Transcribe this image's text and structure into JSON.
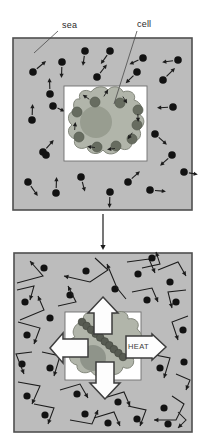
{
  "labels": {
    "sea": "sea",
    "cell": "cell",
    "heat": "HEAT"
  },
  "colors": {
    "background": "#ffffff",
    "sea_fill": "#bcbcbc",
    "panel_border": "#4f4f4f",
    "inner_fill": "#ffffff",
    "inner_border": "#6f6f6f",
    "cell_body": "#b1b5aa",
    "cell_edge": "#83877c",
    "nucleus_top": "#989d90",
    "nucleus_bottom": "#8f948a",
    "organelle": "#676c60",
    "organelle_edge": "#555a4f",
    "bead": "#575b52",
    "bead_edge": "#474b42",
    "dot": "#121212",
    "thin_line": "#1c1c1c",
    "leader_line": "#4a4a4a",
    "fat_arrow_fill": "#fdfdfd",
    "fat_arrow_edge": "#3d3d3d",
    "label_text": "#2a2a2a"
  },
  "top_panel": {
    "square": {
      "x": 13,
      "y": 38,
      "w": 179,
      "h": 172
    },
    "inner_square": {
      "x": 64,
      "y": 86,
      "w": 83,
      "h": 75
    },
    "cell_blob_path": "M 80,99 C 77,92 85,88 91,92 C 95,86 104,85 108,90 C 112,85 121,86 123,92 C 130,89 137,94 134,100 C 141,102 144,109 139,114 C 146,118 145,126 139,129 C 143,135 139,142 132,141 C 133,148 126,152 120,148 C 117,155 107,156 103,150 C 98,156 88,154 87,147 C 80,151 72,146 75,139 C 68,137 66,129 72,125 C 66,120 68,111 75,111 C 72,104 74,98 80,99 Z",
    "nucleus": {
      "cx": 96,
      "cy": 122,
      "r": 16
    },
    "organelles": [
      [
        77,
        112
      ],
      [
        95,
        102
      ],
      [
        120,
        103
      ],
      [
        138,
        110
      ],
      [
        137,
        125
      ],
      [
        132,
        139
      ],
      [
        116,
        146
      ],
      [
        97,
        147
      ],
      [
        79,
        137
      ]
    ],
    "organelle_radius": 5,
    "cell_arrows": [
      [
        86,
        97,
        145
      ],
      [
        106,
        93,
        58
      ],
      [
        125,
        100,
        302
      ],
      [
        138,
        118,
        272
      ],
      [
        130,
        136,
        235
      ],
      [
        111,
        149,
        188
      ],
      [
        91,
        147,
        172
      ],
      [
        75,
        126,
        85
      ]
    ],
    "cell_arrow_len": 8,
    "molecules": [
      [
        33,
        72,
        40,
        12
      ],
      [
        62,
        62,
        268,
        11
      ],
      [
        85,
        51,
        262,
        10
      ],
      [
        110,
        51,
        235,
        11
      ],
      [
        143,
        58,
        205,
        10
      ],
      [
        178,
        60,
        188,
        11
      ],
      [
        137,
        72,
        225,
        11
      ],
      [
        97,
        77,
        52,
        11
      ],
      [
        163,
        80,
        45,
        12
      ],
      [
        50,
        94,
        92,
        11
      ],
      [
        53,
        106,
        335,
        8
      ],
      [
        173,
        107,
        183,
        11
      ],
      [
        32,
        120,
        88,
        11
      ],
      [
        155,
        134,
        318,
        11
      ],
      [
        43,
        152,
        48,
        11
      ],
      [
        172,
        155,
        222,
        11
      ],
      [
        28,
        182,
        305,
        12
      ],
      [
        81,
        177,
        285,
        10
      ],
      [
        56,
        193,
        88,
        11
      ],
      [
        110,
        192,
        268,
        11
      ],
      [
        128,
        182,
        42,
        11
      ],
      [
        150,
        190,
        355,
        11
      ],
      [
        184,
        172,
        350,
        9
      ],
      [
        46,
        155,
        0,
        0
      ]
    ],
    "dot_radius": 3.8,
    "sea_leader": [
      58,
      31,
      34,
      53
    ],
    "cell_leader": [
      137,
      31,
      114,
      104
    ]
  },
  "mid_arrow": {
    "x": 103,
    "y1": 214,
    "y2": 250
  },
  "bottom_panel": {
    "square": {
      "x": 14,
      "y": 253,
      "w": 178,
      "h": 179
    },
    "inner_square": {
      "x": 65,
      "y": 312,
      "w": 76,
      "h": 68
    },
    "cell_blob_path": "M 84,321 C 81,314 89,310 95,314 C 100,308 110,308 114,314 C 120,309 129,312 128,319 C 135,317 141,323 137,329 C 143,333 143,341 137,344 C 142,349 140,357 133,358 C 136,365 129,371 123,367 C 122,374 113,377 108,372 C 103,378 94,377 91,371 C 85,375 76,372 77,365 C 70,364 67,356 72,352 C 66,347 68,339 75,337 C 70,331 76,322 84,321 Z",
    "nucleus": {
      "cx": 93,
      "cy": 358,
      "r": 13
    },
    "beads": {
      "x1": 82,
      "y1": 322,
      "x2": 123,
      "y2": 357,
      "n": 10,
      "r": 3.8
    },
    "fat_arrows": [
      {
        "name": "up",
        "tail": [
          103,
          334
        ],
        "tip": [
          103,
          297
        ],
        "head_len": 16,
        "head_half": 15,
        "shaft_half": 9
      },
      {
        "name": "down",
        "tail": [
          105,
          362
        ],
        "tip": [
          105,
          399
        ],
        "head_len": 16,
        "head_half": 15,
        "shaft_half": 9
      },
      {
        "name": "left",
        "tail": [
          88,
          348
        ],
        "tip": [
          50,
          348
        ],
        "head_len": 13,
        "head_half": 15,
        "shaft_half": 9
      },
      {
        "name": "heat-right",
        "tail": [
          126,
          347
        ],
        "tip": [
          166,
          347
        ],
        "head_len": 14,
        "head_half": 13,
        "shaft_half": 11
      }
    ],
    "dot_radius": 3.6,
    "molecules": [
      {
        "dot": [
          44,
          268
        ],
        "path": [
          [
            17,
            283
          ],
          [
            43,
            276
          ],
          [
            30,
            261
          ]
        ]
      },
      {
        "dot": [
          86,
          271
        ],
        "path": [
          [
            95,
            258
          ],
          [
            108,
            270
          ],
          [
            90,
            282
          ],
          [
            64,
            276
          ]
        ]
      },
      {
        "dot": [
          115,
          289
        ],
        "path": [
          [
            126,
            299
          ],
          [
            117,
            288
          ],
          [
            107,
            264
          ]
        ]
      },
      {
        "dot": [
          138,
          274
        ],
        "path": [
          [
            127,
            262
          ],
          [
            149,
            259
          ],
          [
            155,
            273
          ]
        ]
      },
      {
        "dot": [
          170,
          282
        ],
        "path": [
          [
            158,
            270
          ],
          [
            178,
            262
          ],
          [
            186,
            276
          ]
        ]
      },
      {
        "dot": [
          25,
          302
        ],
        "path": [
          [
            17,
            290
          ],
          [
            34,
            286
          ],
          [
            30,
            300
          ]
        ]
      },
      {
        "dot": [
          70,
          295
        ],
        "path": [
          [
            58,
            306
          ],
          [
            76,
            302
          ],
          [
            68,
            286
          ]
        ]
      },
      {
        "dot": [
          147,
          300
        ],
        "path": [
          [
            132,
            292
          ],
          [
            152,
            288
          ],
          [
            158,
            302
          ]
        ]
      },
      {
        "dot": [
          176,
          302
        ],
        "path": [
          [
            186,
            290
          ],
          [
            168,
            292
          ],
          [
            172,
            308
          ]
        ]
      },
      {
        "dot": [
          50,
          318
        ],
        "path": [
          [
            20,
            320
          ],
          [
            44,
            310
          ],
          [
            38,
            296
          ]
        ]
      },
      {
        "dot": [
          27,
          335
        ],
        "path": [
          [
            18,
            322
          ],
          [
            40,
            328
          ],
          [
            34,
            344
          ]
        ]
      },
      {
        "dot": [
          183,
          330
        ],
        "path": [
          [
            188,
            316
          ],
          [
            172,
            322
          ],
          [
            178,
            340
          ]
        ]
      },
      {
        "dot": [
          22,
          364
        ],
        "path": [
          [
            32,
            352
          ],
          [
            16,
            354
          ],
          [
            24,
            374
          ]
        ]
      },
      {
        "dot": [
          50,
          368
        ],
        "path": [
          [
            42,
            352
          ],
          [
            60,
            356
          ],
          [
            54,
            376
          ]
        ]
      },
      {
        "dot": [
          160,
          368
        ],
        "path": [
          [
            150,
            354
          ],
          [
            170,
            358
          ],
          [
            164,
            378
          ]
        ]
      },
      {
        "dot": [
          184,
          362
        ],
        "path": [
          [
            176,
            374
          ],
          [
            190,
            380
          ],
          [
            186,
            390
          ]
        ]
      },
      {
        "dot": [
          27,
          396
        ],
        "path": [
          [
            18,
            382
          ],
          [
            40,
            386
          ],
          [
            32,
            404
          ]
        ]
      },
      {
        "dot": [
          77,
          394
        ],
        "path": [
          [
            60,
            390
          ],
          [
            80,
            384
          ],
          [
            88,
            398
          ]
        ]
      },
      {
        "dot": [
          118,
          402
        ],
        "path": [
          [
            104,
            398
          ],
          [
            124,
            392
          ],
          [
            130,
            406
          ]
        ]
      },
      {
        "dot": [
          137,
          419
        ],
        "path": [
          [
            128,
            406
          ],
          [
            146,
            410
          ],
          [
            140,
            426
          ]
        ]
      },
      {
        "dot": [
          164,
          408
        ],
        "path": [
          [
            172,
            396
          ],
          [
            184,
            404
          ],
          [
            176,
            420
          ],
          [
            154,
            420
          ]
        ]
      },
      {
        "dot": [
          45,
          415
        ],
        "path": [
          [
            34,
            404
          ],
          [
            54,
            408
          ],
          [
            48,
            424
          ]
        ]
      },
      {
        "dot": [
          85,
          414
        ],
        "path": [
          [
            70,
            420
          ],
          [
            92,
            424
          ],
          [
            98,
            410
          ]
        ]
      },
      {
        "dot": [
          108,
          423
        ],
        "path": [
          [
            94,
            418
          ],
          [
            114,
            412
          ],
          [
            120,
            426
          ]
        ]
      },
      {
        "dot": [
          168,
          424
        ],
        "path": [
          [
            178,
            412
          ],
          [
            186,
            420
          ],
          [
            178,
            428
          ]
        ]
      },
      {
        "dot": [
          152,
          258
        ],
        "path": [
          [
            142,
            268
          ],
          [
            160,
            264
          ],
          [
            156,
            252
          ]
        ]
      }
    ]
  }
}
